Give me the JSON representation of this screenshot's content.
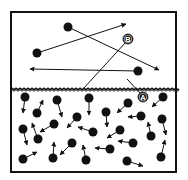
{
  "diagram": {
    "colors": {
      "stroke": "#111111",
      "molecule": "#111111",
      "background": "#ffffff",
      "label_text": "#ffffff"
    },
    "container": {
      "x": 11,
      "y": 12,
      "width": 165,
      "height": 160,
      "stroke_width": 2
    },
    "liquid_surface_y": 89,
    "labels": [
      {
        "id": "A",
        "text": "A",
        "x": 143,
        "y": 97
      },
      {
        "id": "B",
        "text": "B",
        "x": 128,
        "y": 39
      }
    ],
    "label_paths": [
      {
        "label": "A",
        "from": [
          127,
          79
        ],
        "to": [
          141,
          94
        ]
      },
      {
        "label": "B",
        "from": [
          83,
          89
        ],
        "to": [
          126,
          42
        ]
      }
    ],
    "gas_molecules": [
      {
        "x": 68,
        "y": 27,
        "ax": 159,
        "ay": 70
      },
      {
        "x": 37,
        "y": 53,
        "ax": 126,
        "ay": 24
      },
      {
        "x": 138,
        "y": 71,
        "ax": 30,
        "ay": 69
      }
    ],
    "liquid_molecules": [
      {
        "x": 25,
        "y": 97,
        "ax": 23,
        "ay": 113
      },
      {
        "x": 37,
        "y": 113,
        "ax": 43,
        "ay": 100
      },
      {
        "x": 57,
        "y": 100,
        "ax": 62,
        "ay": 117
      },
      {
        "x": 89,
        "y": 98,
        "ax": 89,
        "ay": 115
      },
      {
        "x": 128,
        "y": 103,
        "ax": 117,
        "ay": 113
      },
      {
        "x": 163,
        "y": 97,
        "ax": 152,
        "ay": 107
      },
      {
        "x": 106,
        "y": 112,
        "ax": 107,
        "ay": 127
      },
      {
        "x": 141,
        "y": 116,
        "ax": 128,
        "ay": 117
      },
      {
        "x": 162,
        "y": 119,
        "ax": 166,
        "ay": 135
      },
      {
        "x": 77,
        "y": 117,
        "ax": 67,
        "ay": 128
      },
      {
        "x": 23,
        "y": 129,
        "ax": 27,
        "ay": 145
      },
      {
        "x": 54,
        "y": 124,
        "ax": 40,
        "ay": 132
      },
      {
        "x": 38,
        "y": 139,
        "ax": 32,
        "ay": 123
      },
      {
        "x": 93,
        "y": 132,
        "ax": 78,
        "ay": 127
      },
      {
        "x": 120,
        "y": 130,
        "ax": 107,
        "ay": 138
      },
      {
        "x": 151,
        "y": 136,
        "ax": 148,
        "ay": 122
      },
      {
        "x": 72,
        "y": 143,
        "ax": 60,
        "ay": 155
      },
      {
        "x": 133,
        "y": 143,
        "ax": 118,
        "ay": 141
      },
      {
        "x": 53,
        "y": 158,
        "ax": 54,
        "ay": 142
      },
      {
        "x": 110,
        "y": 149,
        "ax": 95,
        "ay": 148
      },
      {
        "x": 23,
        "y": 159,
        "ax": 37,
        "ay": 152
      },
      {
        "x": 86,
        "y": 160,
        "ax": 83,
        "ay": 145
      },
      {
        "x": 127,
        "y": 161,
        "ax": 143,
        "ay": 166
      },
      {
        "x": 161,
        "y": 157,
        "ax": 165,
        "ay": 140
      }
    ]
  }
}
